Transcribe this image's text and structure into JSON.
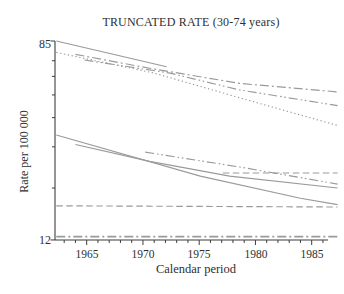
{
  "chart_data": {
    "type": "line",
    "title": "TRUNCATED RATE (30-74 years)",
    "xlabel": "Calendar period",
    "ylabel": "Rate per 100 000",
    "xlim": [
      1962.2,
      1986.4
    ],
    "ylim": [
      12,
      85
    ],
    "yscale": "log",
    "grid": false,
    "legend": "none",
    "x_major_ticks": [
      "1965",
      "1970",
      "1975",
      "1980",
      "1985"
    ],
    "x_minor_tick_step": 1,
    "x_minor_tick_range": [
      1963,
      1986
    ],
    "y_labeled_ticks": [
      "85",
      "12"
    ],
    "y_minor_ticks": [
      70,
      60,
      50,
      40,
      30,
      20
    ],
    "axis_color": "#3d3d3d",
    "line_color": "#9a9a9a",
    "series": [
      {
        "id": "upper-solid",
        "style": "solid",
        "points": [
          [
            1962.3,
            85
          ],
          [
            1972.1,
            66
          ]
        ]
      },
      {
        "id": "upper-dash-dot",
        "style": "dashdot",
        "points": [
          [
            1964.0,
            74.5
          ],
          [
            1970.6,
            65
          ],
          [
            1978.6,
            56
          ],
          [
            1987.3,
            51.5
          ]
        ]
      },
      {
        "id": "upper-dash-dot-dot",
        "style": "dashdotdot",
        "points": [
          [
            1964.8,
            70.5
          ],
          [
            1972.4,
            62
          ],
          [
            1978.6,
            52.5
          ],
          [
            1987.3,
            45
          ]
        ]
      },
      {
        "id": "upper-dotted",
        "style": "dotted",
        "points": [
          [
            1962.3,
            76
          ],
          [
            1971.0,
            62
          ],
          [
            1979.0,
            48
          ],
          [
            1987.3,
            37
          ]
        ]
      },
      {
        "id": "mid-solid-steep",
        "style": "solid",
        "points": [
          [
            1962.3,
            33.7
          ],
          [
            1975.1,
            22.5
          ],
          [
            1984.0,
            18.1
          ],
          [
            1987.3,
            17
          ]
        ]
      },
      {
        "id": "mid-solid-shallow",
        "style": "solid",
        "points": [
          [
            1964.0,
            30.7
          ],
          [
            1970.6,
            26
          ],
          [
            1977.7,
            22.5
          ],
          [
            1987.3,
            20
          ]
        ]
      },
      {
        "id": "mid-dash-dot-dot",
        "style": "dashdotdot",
        "points": [
          [
            1970.2,
            28.5
          ],
          [
            1978.6,
            24.6
          ],
          [
            1987.3,
            20.8
          ]
        ]
      },
      {
        "id": "mid-dashed-flat",
        "style": "dashed",
        "points": [
          [
            1977.1,
            23.2
          ],
          [
            1987.3,
            23.2
          ]
        ]
      },
      {
        "id": "lower-dashed-flat",
        "style": "dashed",
        "points": [
          [
            1962.3,
            16.8
          ],
          [
            1987.3,
            16.6
          ]
        ]
      },
      {
        "id": "bottom-dash-dot-flat",
        "style": "dashdot",
        "width": 1.6,
        "points": [
          [
            1962.3,
            12.4
          ],
          [
            1987.3,
            12.4
          ]
        ]
      }
    ]
  }
}
